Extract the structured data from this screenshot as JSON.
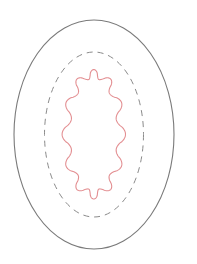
{
  "canvas": {
    "width": 197,
    "height": 264,
    "background": "#ffffff"
  },
  "shapes": {
    "outer_ellipse": {
      "cx": 94,
      "cy": 134.5,
      "rx": 80,
      "ry": 114.5,
      "stroke": "#7a7a7a",
      "stroke_width": 1.1,
      "dash": "none"
    },
    "dashed_ellipse": {
      "cx": 94,
      "cy": 134.5,
      "rx": 49.5,
      "ry": 82.5,
      "stroke": "#8a8a8a",
      "stroke_width": 1.0,
      "dash": "6 5"
    },
    "wavy_boundary": {
      "cx": 93.8,
      "cy": 134.3,
      "rx": 27.5,
      "ry": 60.5,
      "amplitude": 4.2,
      "lobes": 12,
      "samples": 480,
      "stroke": "#e38f92",
      "stroke_width": 1.1
    }
  }
}
